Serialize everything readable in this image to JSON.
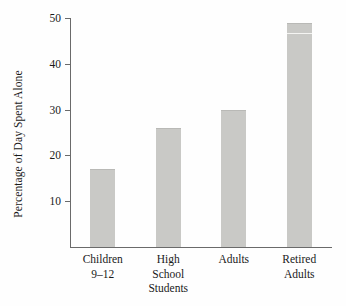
{
  "chart_data": {
    "type": "bar",
    "title": "",
    "xlabel": "",
    "ylabel": "Percentage of Day Spent Alone",
    "categories": [
      "Children\n9–12",
      "High\nSchool\nStudents",
      "Adults",
      "Retired\nAdults"
    ],
    "values": [
      17,
      26,
      30,
      49
    ],
    "ylim": [
      0,
      50
    ],
    "yticks": [
      10,
      20,
      30,
      40,
      50
    ],
    "ytick_labels": [
      "10",
      "20",
      "30",
      "40",
      "50"
    ],
    "grid": false,
    "legend": "none",
    "bar_color": "#c9c9c6",
    "axis_color": "#6a6a6a",
    "background": "#fefefe"
  }
}
